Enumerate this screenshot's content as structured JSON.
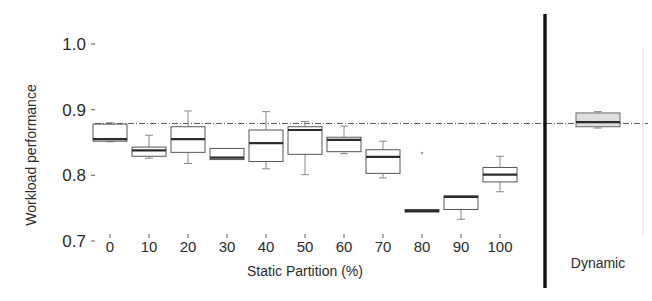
{
  "chart_data": {
    "type": "box",
    "title": "",
    "xlabel": "Static Partition (%)",
    "ylabel": "Workload performance",
    "ylim": [
      0.7,
      1.02
    ],
    "yticks": [
      1.0,
      0.9,
      0.8,
      0.7
    ],
    "ytick_labels": [
      "1.0",
      "0.9",
      "0.8",
      "0.7"
    ],
    "categories": [
      "0",
      "10",
      "20",
      "30",
      "40",
      "50",
      "60",
      "70",
      "80",
      "90",
      "100"
    ],
    "group_labels": [
      "Static Partition (%)",
      "Dynamic"
    ],
    "grid": false,
    "legend": "none",
    "reference_line": {
      "value": 0.879,
      "style": "dash-dot",
      "label": ""
    },
    "separator": {
      "after_category": "100",
      "style": "solid-vertical-thick"
    },
    "boxes": [
      {
        "category": "0",
        "whisker_low": 0.851,
        "q1": 0.852,
        "median": 0.855,
        "q3": 0.878,
        "whisker_high": 0.88
      },
      {
        "category": "10",
        "whisker_low": 0.826,
        "q1": 0.829,
        "median": 0.838,
        "q3": 0.843,
        "whisker_high": 0.861
      },
      {
        "category": "20",
        "whisker_low": 0.818,
        "q1": 0.835,
        "median": 0.855,
        "q3": 0.874,
        "whisker_high": 0.898
      },
      {
        "category": "30",
        "whisker_low": 0.824,
        "q1": 0.824,
        "median": 0.827,
        "q3": 0.841,
        "whisker_high": 0.841
      },
      {
        "category": "40",
        "whisker_low": 0.81,
        "q1": 0.821,
        "median": 0.849,
        "q3": 0.869,
        "whisker_high": 0.897
      },
      {
        "category": "50",
        "whisker_low": 0.801,
        "q1": 0.832,
        "median": 0.869,
        "q3": 0.874,
        "whisker_high": 0.882
      },
      {
        "category": "60",
        "whisker_low": 0.833,
        "q1": 0.836,
        "median": 0.854,
        "q3": 0.858,
        "whisker_high": 0.875
      },
      {
        "category": "70",
        "whisker_low": 0.796,
        "q1": 0.803,
        "median": 0.828,
        "q3": 0.839,
        "whisker_high": 0.852
      },
      {
        "category": "80",
        "whisker_low": 0.744,
        "q1": 0.744,
        "median": 0.746,
        "q3": 0.748,
        "whisker_high": 0.748
      },
      {
        "category": "90",
        "whisker_low": 0.733,
        "q1": 0.748,
        "median": 0.767,
        "q3": 0.769,
        "whisker_high": 0.769
      },
      {
        "category": "100",
        "whisker_low": 0.775,
        "q1": 0.79,
        "median": 0.801,
        "q3": 0.812,
        "whisker_high": 0.829
      },
      {
        "category": "Dynamic",
        "whisker_low": 0.872,
        "q1": 0.874,
        "median": 0.881,
        "q3": 0.895,
        "whisker_high": 0.897,
        "filled": true
      }
    ],
    "outliers": [
      {
        "category": "80",
        "value": 0.834
      }
    ],
    "colors": {
      "box_fill": "#ffffff",
      "box_fill_dynamic": "#dededd",
      "box_stroke": "#555555",
      "median": "#2b2b2b",
      "whisker": "#8a8a8a",
      "reference_line": "#5a5a5a",
      "separator": "#111111",
      "text": "#2b2b2b",
      "background": "#ffffff"
    }
  }
}
